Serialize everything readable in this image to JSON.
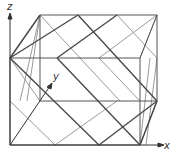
{
  "diagram": {
    "type": "3d-wireframe-polyhedron-in-cube",
    "axes": {
      "x_label": "x",
      "y_label": "y",
      "z_label": "z"
    },
    "colors": {
      "dark_line": "#4a4a4a",
      "light_line": "#9a9a9a",
      "axis": "#333333",
      "background": "#ffffff"
    },
    "cube": {
      "front": [
        [
          10,
          58
        ],
        [
          140,
          58
        ],
        [
          140,
          145
        ],
        [
          10,
          145
        ]
      ],
      "back": [
        [
          40,
          15
        ],
        [
          157,
          15
        ],
        [
          157,
          101
        ],
        [
          40,
          101
        ]
      ]
    },
    "dark_lines": [
      [
        [
          10,
          58
        ],
        [
          78,
          15
        ]
      ],
      [
        [
          10,
          58
        ],
        [
          99,
          145
        ]
      ],
      [
        [
          57,
          58
        ],
        [
          117,
          15
        ]
      ],
      [
        [
          57,
          58
        ],
        [
          140,
          145
        ]
      ],
      [
        [
          78,
          15
        ],
        [
          157,
          101
        ]
      ],
      [
        [
          10,
          58
        ],
        [
          40,
          15
        ]
      ],
      [
        [
          140,
          145
        ],
        [
          157,
          101
        ]
      ],
      [
        [
          99,
          145
        ],
        [
          157,
          101
        ]
      ]
    ],
    "light_lines": [
      [
        [
          10,
          58
        ],
        [
          40,
          101
        ]
      ],
      [
        [
          40,
          15
        ],
        [
          120,
          101
        ]
      ],
      [
        [
          99,
          58
        ],
        [
          157,
          15
        ]
      ],
      [
        [
          99,
          58
        ],
        [
          140,
          101
        ]
      ],
      [
        [
          55,
          145
        ],
        [
          10,
          101
        ]
      ],
      [
        [
          55,
          145
        ],
        [
          117,
          101
        ]
      ],
      [
        [
          117,
          15
        ],
        [
          157,
          58
        ]
      ],
      [
        [
          140,
          58
        ],
        [
          157,
          15
        ]
      ],
      [
        [
          40,
          15
        ],
        [
          27,
          101
        ]
      ],
      [
        [
          40,
          15
        ],
        [
          20,
          101
        ]
      ],
      [
        [
          140,
          145
        ],
        [
          150,
          58
        ]
      ],
      [
        [
          146,
          145
        ],
        [
          157,
          58
        ]
      ]
    ]
  }
}
